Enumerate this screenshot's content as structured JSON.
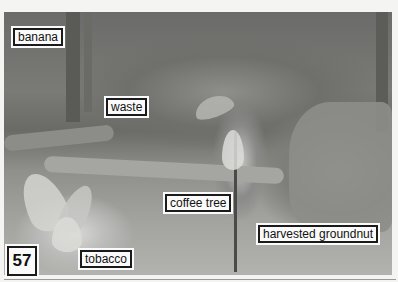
{
  "figure": {
    "number": "57",
    "type": "grayscale photograph",
    "labels": [
      {
        "id": "banana",
        "text": "banana"
      },
      {
        "id": "waste",
        "text": "waste"
      },
      {
        "id": "coffee-tree",
        "text": "coffee tree"
      },
      {
        "id": "harvested-groundnut",
        "text": "harvested groundnut"
      },
      {
        "id": "tobacco",
        "text": "tobacco"
      }
    ]
  },
  "colors": {
    "label_background": "#fafafa",
    "label_border": "#1a1a1a",
    "page_background": "#f4f4f2"
  }
}
